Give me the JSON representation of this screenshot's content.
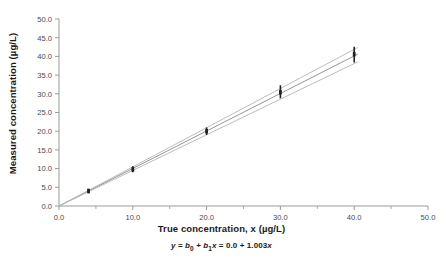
{
  "chart_data": {
    "type": "line",
    "title": "",
    "xlabel": "True concentration, x (µg/L)",
    "ylabel": "Measured concentration (µg/L)",
    "equation_parts": {
      "lhs": "y",
      "eq1": " = ",
      "b0": "b",
      "b0sub": "0",
      "plus": " + ",
      "b1": "b",
      "b1sub": "1",
      "xvar": "x",
      "eq2": " = ",
      "intercept": "0.0",
      "plus2": " + ",
      "slope": "1.003",
      "xvar2": "x"
    },
    "equation_text": "y = b0 + b1x = 0.0 + 1.003x",
    "xlim": [
      0.0,
      50.0
    ],
    "ylim": [
      0.0,
      50.0
    ],
    "xticks": [
      0.0,
      10.0,
      20.0,
      30.0,
      40.0,
      50.0
    ],
    "xtick_labels": [
      "0.0",
      "10.0",
      "20.0",
      "30.0",
      "40.0",
      "50.0"
    ],
    "x_minor_ticks": [
      5.0,
      15.0,
      25.0,
      35.0,
      45.0
    ],
    "yticks": [
      0.0,
      5.0,
      10.0,
      15.0,
      20.0,
      25.0,
      30.0,
      35.0,
      40.0,
      45.0,
      50.0
    ],
    "ytick_labels": [
      "0.0",
      "5.0",
      "10.0",
      "15.0",
      "20.0",
      "25.0",
      "30.0",
      "35.0",
      "40.0",
      "45.0",
      "50.0"
    ],
    "grid": false,
    "legend": "none",
    "intercept": 0.0,
    "slope": 1.003,
    "series": [
      {
        "name": "regression-line",
        "type": "line",
        "slope": 1.003,
        "intercept": 0.0,
        "x": [
          0.0,
          40.5
        ],
        "y": [
          0.0,
          40.62
        ],
        "color": "#8a8a8a"
      },
      {
        "name": "upper-confidence-line",
        "type": "line",
        "slope": 1.047,
        "intercept": 0.0,
        "x": [
          0.0,
          40.5
        ],
        "y": [
          0.0,
          42.4
        ],
        "color": "#b4b4b4"
      },
      {
        "name": "lower-confidence-line",
        "type": "line",
        "slope": 0.952,
        "intercept": 0.0,
        "x": [
          0.0,
          40.5
        ],
        "y": [
          0.0,
          38.56
        ],
        "color": "#b4b4b4"
      }
    ],
    "error_bar_points": [
      {
        "x": 4.0,
        "y": 4.0,
        "ylow": 3.4,
        "yhigh": 4.6
      },
      {
        "x": 10.0,
        "y": 9.8,
        "ylow": 9.0,
        "yhigh": 10.6
      },
      {
        "x": 20.0,
        "y": 20.0,
        "ylow": 19.0,
        "yhigh": 21.0
      },
      {
        "x": 30.0,
        "y": 30.4,
        "ylow": 28.8,
        "yhigh": 32.3
      },
      {
        "x": 40.0,
        "y": 40.6,
        "ylow": 38.4,
        "yhigh": 42.6
      }
    ],
    "colors": {
      "axis": "#9a9a9a",
      "tick_text": "#4a4a4a",
      "marker": "#222222",
      "fit_line": "#8a8a8a",
      "band_line": "#b4b4b4",
      "background": "#ffffff"
    }
  }
}
